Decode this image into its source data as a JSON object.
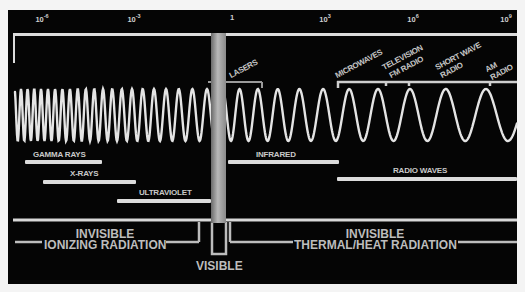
{
  "diagram": {
    "colors": {
      "background": "#050505",
      "foreground": "#dcdcdc",
      "text": "#c9c9c9",
      "visible_band": "#8a8a8a"
    },
    "scale": {
      "ticks": [
        {
          "base": "10",
          "exp": "-6",
          "x": 42
        },
        {
          "base": "10",
          "exp": "-3",
          "x": 134
        },
        {
          "base": "1",
          "exp": "",
          "x": 232
        },
        {
          "base": "10",
          "exp": "3",
          "x": 325
        },
        {
          "base": "10",
          "exp": "6",
          "x": 413
        },
        {
          "base": "10",
          "exp": "9",
          "x": 506
        }
      ]
    },
    "rotated_labels": {
      "lasers": "LASERS",
      "microwaves": "MICROWAVES",
      "television": "TELEVISION",
      "fm_radio": "FM RADIO",
      "short_wave": "SHORT WAVE",
      "short_wave_radio": "RADIO",
      "am": "AM",
      "am_radio": "RADIO"
    },
    "bands": {
      "gamma_rays": "GAMMA RAYS",
      "x_rays": "X-RAYS",
      "ultraviolet": "ULTRAVIOLET",
      "infrared": "INFRARED",
      "radio_waves": "RADIO WAVES"
    },
    "regions": {
      "left_line1": "INVISIBLE",
      "left_line2": "IONIZING RADIATION",
      "right_line1": "INVISIBLE",
      "right_line2": "THERMAL/HEAT RADIATION",
      "visible": "VISIBLE"
    }
  }
}
